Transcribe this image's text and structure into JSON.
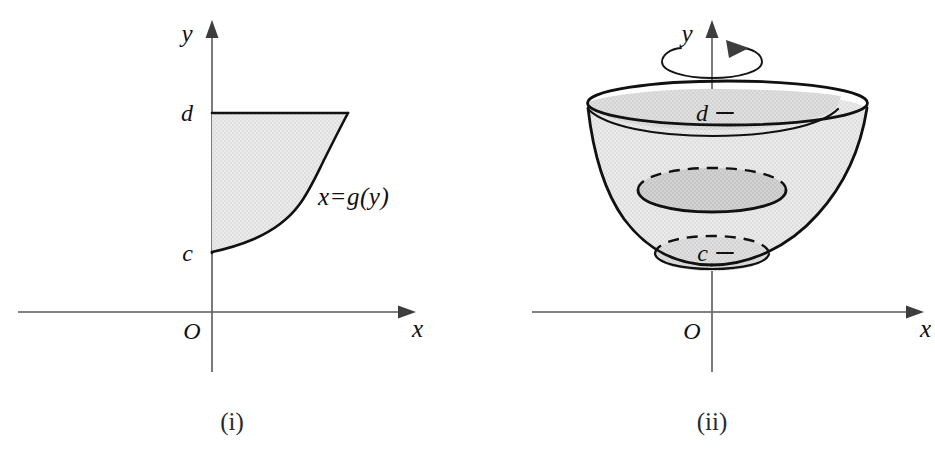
{
  "figure": {
    "panels": [
      {
        "id": "panel-i",
        "caption": "(i)",
        "axes": {
          "x_label": "x",
          "y_label": "y",
          "origin_label": "O"
        },
        "tick_labels": {
          "lower": "c",
          "upper": "d"
        },
        "curve_label": "x=g(y)",
        "description": "Plane region bounded on the left by the y-axis, above by the horizontal line y=d, below by y=c, and on the right by the curve x=g(y)."
      },
      {
        "id": "panel-ii",
        "caption": "(ii)",
        "axes": {
          "x_label": "x",
          "y_label": "y",
          "origin_label": "O"
        },
        "tick_labels": {
          "lower": "c",
          "upper": "d"
        },
        "rotation_indicator": "rotation-arrow-about-y-axis",
        "description": "Solid of revolution, a flared bowl, obtained by revolving the region in (i) about the y-axis, with hidden back edges drawn dashed."
      }
    ],
    "colors": {
      "region_fill": "#e7e7e7",
      "solid_fill": "#e3e3e3",
      "solid_fill_shadow": "#cfcfcf",
      "outline": "#111111",
      "axis": "#5a5a5a",
      "background": "#ffffff"
    }
  }
}
